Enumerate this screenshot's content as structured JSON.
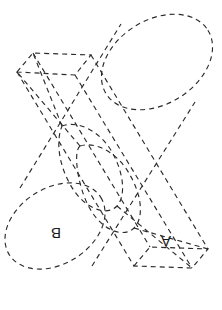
{
  "figure": {
    "kind": "engineering-drawing",
    "canvas": {
      "width": 222,
      "height": 310
    },
    "style": {
      "background_color": "#ffffff",
      "line_color": "#2b2b2b",
      "line_width": 1.15,
      "dash_pattern": "5 4",
      "label_color": "#1a1a1a",
      "label_font_size": 15
    },
    "labels": [
      {
        "id": "label-a",
        "text": "A",
        "solid": "rectangular-prism",
        "x": 166,
        "y": 240,
        "rotation_deg": 180,
        "note": "label on the near top face of the prism, printed rotated"
      },
      {
        "id": "label-b",
        "text": "B",
        "solid": "cylinder",
        "x": 56,
        "y": 232,
        "rotation_deg": 180,
        "note": "label on the near circular end face of the cylinder, printed rotated"
      }
    ],
    "solids": [
      {
        "id": "cylinder",
        "label": "B",
        "type": "cylinder",
        "axis_from": {
          "x": 55,
          "y": 226
        },
        "axis_to": {
          "x": 157,
          "y": 62
        },
        "near_cap": {
          "cx": 55,
          "cy": 226,
          "rx": 54,
          "ry": 38,
          "rotation_deg": -32
        },
        "far_cap": {
          "cx": 157,
          "cy": 62,
          "rx": 60,
          "ry": 42,
          "rotation_deg": -32
        }
      },
      {
        "id": "rectangular-prism",
        "label": "A",
        "type": "rectangular-prism",
        "axis_from": {
          "x": 54,
          "y": 72
        },
        "axis_to": {
          "x": 172,
          "y": 266
        },
        "near_face_corners": [
          {
            "x": 17,
            "y": 72
          },
          {
            "x": 33,
            "y": 53
          },
          {
            "x": 91,
            "y": 55
          },
          {
            "x": 75,
            "y": 75
          }
        ],
        "far_face_corners": [
          {
            "x": 134,
            "y": 266
          },
          {
            "x": 150,
            "y": 247
          },
          {
            "x": 208,
            "y": 249
          },
          {
            "x": 192,
            "y": 268
          }
        ]
      }
    ],
    "intersection": {
      "present": true,
      "curve_count": 2,
      "description": "Two closed interpenetration curves where the prism passes through the cylinder wall"
    }
  }
}
